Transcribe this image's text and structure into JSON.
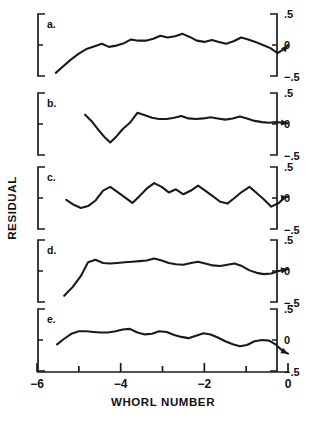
{
  "figure": {
    "xlabel": "WHORL NUMBER",
    "ylabel": "RESIDUAL"
  },
  "chart_data": {
    "type": "line",
    "title": "",
    "xlabel": "WHORL NUMBER",
    "ylabel": "RESIDUAL",
    "xlim": [
      -6,
      0
    ],
    "ylim": [
      -0.5,
      0.5
    ],
    "grid": false,
    "legend": "none",
    "xticks": [
      -6,
      -5,
      -4,
      -3,
      -2,
      -1,
      0
    ],
    "xtick_labels": [
      "−6",
      "",
      "−4",
      "",
      "−2",
      "",
      "0"
    ],
    "yticks": [
      0.5,
      0,
      -0.5
    ],
    "ytick_labels": [
      ".5",
      "0",
      "−.5"
    ],
    "panels": [
      {
        "label": "a.",
        "x": [
          -5.55,
          -5.4,
          -5.2,
          -5.0,
          -4.8,
          -4.62,
          -4.45,
          -4.28,
          -4.1,
          -3.92,
          -3.75,
          -3.58,
          -3.4,
          -3.22,
          -3.05,
          -2.88,
          -2.7,
          -2.52,
          -2.35,
          -2.18,
          -2.0,
          -1.82,
          -1.65,
          -1.48,
          -1.3,
          -1.12,
          -0.95,
          -0.78,
          -0.6,
          -0.42,
          -0.25,
          -0.08,
          0.0
        ],
        "y": [
          -0.45,
          -0.36,
          -0.24,
          -0.14,
          -0.06,
          -0.02,
          0.02,
          -0.03,
          -0.01,
          0.03,
          0.09,
          0.07,
          0.07,
          0.1,
          0.15,
          0.12,
          0.14,
          0.18,
          0.13,
          0.07,
          0.05,
          0.08,
          0.05,
          0.02,
          0.06,
          0.12,
          0.09,
          0.05,
          0.0,
          -0.05,
          -0.13,
          -0.06,
          0.0
        ]
      },
      {
        "label": "b.",
        "x": [
          -4.85,
          -4.7,
          -4.55,
          -4.4,
          -4.25,
          -4.1,
          -3.95,
          -3.78,
          -3.6,
          -3.42,
          -3.25,
          -3.08,
          -2.9,
          -2.72,
          -2.55,
          -2.38,
          -2.2,
          -2.02,
          -1.85,
          -1.68,
          -1.5,
          -1.32,
          -1.15,
          -0.98,
          -0.8,
          -0.62,
          -0.45,
          -0.28,
          -0.12,
          0.0
        ],
        "y": [
          0.15,
          0.05,
          -0.08,
          -0.2,
          -0.3,
          -0.2,
          -0.08,
          0.02,
          0.18,
          0.14,
          0.1,
          0.08,
          0.08,
          0.1,
          0.13,
          0.09,
          0.08,
          0.09,
          0.11,
          0.09,
          0.07,
          0.09,
          0.12,
          0.09,
          0.05,
          0.03,
          0.02,
          0.03,
          0.02,
          0.01
        ]
      },
      {
        "label": "c.",
        "x": [
          -5.3,
          -5.12,
          -4.95,
          -4.78,
          -4.6,
          -4.42,
          -4.25,
          -4.08,
          -3.9,
          -3.72,
          -3.55,
          -3.38,
          -3.2,
          -3.02,
          -2.85,
          -2.68,
          -2.5,
          -2.32,
          -2.15,
          -1.98,
          -1.8,
          -1.62,
          -1.45,
          -1.28,
          -1.1,
          -0.92,
          -0.75,
          -0.58,
          -0.4,
          -0.22,
          -0.08,
          0.0
        ],
        "y": [
          -0.03,
          -0.11,
          -0.16,
          -0.13,
          -0.04,
          0.12,
          0.18,
          0.1,
          0.01,
          -0.08,
          0.03,
          0.15,
          0.24,
          0.18,
          0.09,
          0.14,
          0.06,
          0.12,
          0.2,
          0.12,
          0.03,
          -0.06,
          -0.09,
          0.0,
          0.1,
          0.18,
          0.08,
          -0.02,
          -0.14,
          -0.08,
          0.01,
          0.02
        ]
      },
      {
        "label": "d.",
        "x": [
          -5.35,
          -5.15,
          -4.95,
          -4.78,
          -4.6,
          -4.42,
          -4.25,
          -4.08,
          -3.9,
          -3.72,
          -3.55,
          -3.38,
          -3.2,
          -3.02,
          -2.85,
          -2.68,
          -2.5,
          -2.32,
          -2.15,
          -1.98,
          -1.8,
          -1.62,
          -1.45,
          -1.28,
          -1.1,
          -0.92,
          -0.75,
          -0.58,
          -0.4,
          -0.22,
          -0.08,
          0.0
        ],
        "y": [
          -0.4,
          -0.26,
          -0.08,
          0.14,
          0.18,
          0.13,
          0.12,
          0.13,
          0.14,
          0.15,
          0.16,
          0.17,
          0.2,
          0.17,
          0.13,
          0.11,
          0.1,
          0.13,
          0.15,
          0.12,
          0.09,
          0.08,
          0.1,
          0.12,
          0.08,
          0.01,
          -0.03,
          -0.05,
          -0.04,
          0.0,
          0.02,
          0.03
        ]
      },
      {
        "label": "e.",
        "x": [
          -5.52,
          -5.35,
          -5.18,
          -5.0,
          -4.82,
          -4.65,
          -4.48,
          -4.3,
          -4.12,
          -3.95,
          -3.78,
          -3.6,
          -3.42,
          -3.25,
          -3.08,
          -2.9,
          -2.72,
          -2.55,
          -2.38,
          -2.2,
          -2.02,
          -1.85,
          -1.68,
          -1.5,
          -1.32,
          -1.15,
          -0.98,
          -0.8,
          -0.62,
          -0.45,
          -0.28,
          -0.12,
          0.0
        ],
        "y": [
          -0.07,
          0.02,
          0.1,
          0.14,
          0.14,
          0.13,
          0.12,
          0.12,
          0.14,
          0.17,
          0.18,
          0.12,
          0.09,
          0.1,
          0.14,
          0.13,
          0.08,
          0.05,
          0.03,
          0.07,
          0.11,
          0.09,
          0.04,
          -0.02,
          -0.07,
          -0.1,
          -0.08,
          -0.02,
          0.0,
          -0.01,
          -0.08,
          -0.18,
          -0.22
        ]
      }
    ]
  }
}
